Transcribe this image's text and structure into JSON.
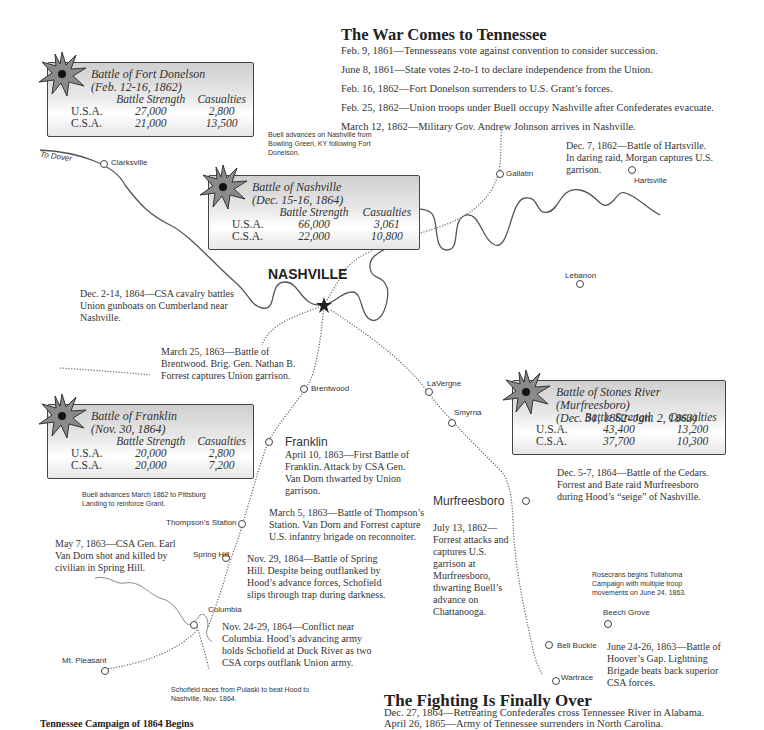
{
  "sections": {
    "war_comes": {
      "heading": "The War Comes to Tennessee",
      "events": [
        "Feb. 9, 1861—Tennesseans vote against convention to consider succession.",
        "June 8, 1861—State votes 2-to-1 to declare independence from the Union.",
        "Feb. 16, 1862—Fort Donelson surrenders to U.S. Grant’s forces.",
        "Feb. 25, 1862—Union troops under Buell occupy Nashville after Confederates evacuate.",
        "March 12, 1862—Military Gov. Andrew Johnson arrives in Nashville."
      ]
    },
    "fighting_over": {
      "heading": "The Fighting Is Finally Over",
      "events": [
        "Dec. 27, 1864—Retreating Confederates cross Tennessee River in Alabama.",
        "April 26, 1865—Army of Tennessee surrenders in North Carolina."
      ]
    },
    "campaign_1864": {
      "heading": "Tennessee Campaign of 1864 Begins"
    }
  },
  "battles": {
    "fort_donelson": {
      "title": "Battle of Fort Donelson",
      "dates": "(Feb. 12-16, 1862)",
      "col_strength": "Battle Strength",
      "col_casualties": "Casualties",
      "rows": [
        {
          "side": "U.S.A.",
          "strength": "27,000",
          "casualties": "2,800"
        },
        {
          "side": "C.S.A.",
          "strength": "21,000",
          "casualties": "13,500"
        }
      ]
    },
    "nashville": {
      "title": "Battle of Nashville",
      "dates": "(Dec. 15-16, 1864)",
      "col_strength": "Battle Strength",
      "col_casualties": "Casualties",
      "rows": [
        {
          "side": "U.S.A.",
          "strength": "66,000",
          "casualties": "3,061"
        },
        {
          "side": "C.S.A.",
          "strength": "22,000",
          "casualties": "10,800"
        }
      ]
    },
    "franklin": {
      "title": "Battle of Franklin",
      "dates": "(Nov. 30, 1864)",
      "col_strength": "Battle Strength",
      "col_casualties": "Casualties",
      "rows": [
        {
          "side": "U.S.A.",
          "strength": "20,000",
          "casualties": "2,800"
        },
        {
          "side": "C.S.A.",
          "strength": "20,000",
          "casualties": "7,200"
        }
      ]
    },
    "stones_river": {
      "title": "Battle of Stones River (Murfreesboro)",
      "dates": "(Dec. 31, 1862–Jan. 2, 1863)",
      "col_strength": "Battle Strength",
      "col_casualties": "Casualties",
      "rows": [
        {
          "side": "U.S.A.",
          "strength": "43,400",
          "casualties": "13,200"
        },
        {
          "side": "C.S.A.",
          "strength": "37,700",
          "casualties": "10,300"
        }
      ]
    }
  },
  "towns": {
    "nashville": "NASHVILLE",
    "clarksville": "Clarksville",
    "to_dover": "To Dover",
    "gallatin": "Gallatin",
    "hartsville": "Hartsville",
    "lebanon": "Lebanon",
    "brentwood": "Brentwood",
    "lavergne": "LaVergne",
    "smyrna": "Smyrna",
    "franklin": "Franklin",
    "murfreesboro": "Murfreesboro",
    "thompsons_station": "Thompson’s Station",
    "spring_hill": "Spring Hill",
    "columbia": "Columbia",
    "mt_pleasant": "Mt. Pleasant",
    "beech_grove": "Beech Grove",
    "bell_buckle": "Bell Buckle",
    "wartrace": "Wartrace"
  },
  "notes": {
    "buell_nashville": "Buell advances on Nashville from Bowling Green, KY following Fort Donelson.",
    "hartsville": "Dec. 7, 1862—Battle of Hartsville. In daring raid, Morgan captures U.S. garrison.",
    "cumberland": "Dec. 2-14, 1864—CSA cavalry battles Union gunboats on Cumberland near Nashville.",
    "brentwood": "March 25, 1863—Battle of Brentwood. Brig. Gen. Nathan B. Forrest captures Union garrison.",
    "cedars": "Dec. 5-7, 1864—Battle of the Cedars. Forrest and Bate raid Murfreesboro during Hood’s “seige” of Nashville.",
    "buell_pittsburg": "Buell advances March 1862 to Pittsburg Landing to reinforce Grant.",
    "franklin_first": "April 10, 1863—First Battle of Franklin. Attack by CSA Gen. Van Dorn thwarted by Union garrison.",
    "thompsons": "March 5, 1863—Battle of Thompson’s Station. Van Dorn and Forrest capture U.S. infantry brigade on reconnoiter.",
    "murfreesboro_raid": "July 13, 1862—Forrest attacks and captures U.S. garrison at Murfreesboro, thwarting Buell’s advance on Chattanooga.",
    "van_dorn": "May 7, 1863—CSA Gen. Earl Van Dorn shot and killed by civilian in Spring Hill.",
    "spring_hill": "Nov. 29, 1864—Battle of Spring Hill. Despite being outflanked by Hood’s advance forces, Schofield slips through trap during darkness.",
    "tullahoma": "Rosecrans begins Tullahoma Campaign with multiple troop movements on June 24, 1863.",
    "columbia": "Nov. 24-29, 1864—Conflict near Columbia. Hood’s advancing army holds Schofield at Duck River as two CSA corps outflank Union army.",
    "hoovers_gap": "June 24-26, 1863—Battle of Hoover’s Gap. Lightning Brigade beats back superior CSA forces.",
    "schofield": "Schofield races from Pulaski to beat Hood to Nashville, Nov. 1864."
  },
  "icons": {
    "battle_marker": "explosion-star-icon",
    "capital_marker": "star-icon",
    "town_marker": "circle-icon"
  },
  "colors": {
    "river": "#555555",
    "route": "#666666",
    "box_border": "#444444",
    "star_fill": "#8a8a8a"
  }
}
